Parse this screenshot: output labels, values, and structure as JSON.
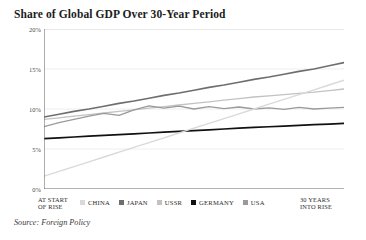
{
  "title": "Share of Global GDP Over 30-Year Period",
  "source": "Source: Foreign Policy",
  "axis": {
    "start_label_line1": "AT START",
    "start_label_line2": "OF RISE",
    "end_label_line1": "30 YEARS",
    "end_label_line2": "INTO RISE"
  },
  "legend": {
    "items": [
      {
        "label": "CHINA",
        "color": "#d9d9d9"
      },
      {
        "label": "JAPAN",
        "color": "#6e6e6e"
      },
      {
        "label": "USSR",
        "color": "#c2c2c2"
      },
      {
        "label": "GERMANY",
        "color": "#111111"
      },
      {
        "label": "USA",
        "color": "#9a9a9a"
      }
    ]
  },
  "chart_data": {
    "type": "line",
    "title": "Share of Global GDP Over 30-Year Period",
    "xlabel": "",
    "ylabel": "",
    "xlim": [
      0,
      30
    ],
    "ylim": [
      0,
      20
    ],
    "yticks": [
      0,
      5,
      10,
      15,
      20
    ],
    "ytick_labels": [
      "0%",
      "5%",
      "10%",
      "15%",
      "20%"
    ],
    "xtick_labels": [
      "AT START OF RISE",
      "30 YEARS INTO RISE"
    ],
    "grid": true,
    "legend_position": "bottom",
    "x": [
      0,
      1.5,
      3,
      4.5,
      6,
      7.5,
      9,
      10.5,
      12,
      13.5,
      15,
      16.5,
      18,
      19.5,
      21,
      22.5,
      24,
      25.5,
      27,
      28.5,
      30
    ],
    "series": [
      {
        "name": "JAPAN",
        "color": "#6e6e6e",
        "width": 1.6,
        "values": [
          9.0,
          9.35,
          9.7,
          10.0,
          10.35,
          10.7,
          11.0,
          11.35,
          11.7,
          12.0,
          12.35,
          12.7,
          13.0,
          13.35,
          13.7,
          14.0,
          14.35,
          14.7,
          15.0,
          15.4,
          15.8
        ]
      },
      {
        "name": "USSR",
        "color": "#c2c2c2",
        "width": 1.3,
        "values": [
          8.7,
          8.9,
          9.1,
          9.3,
          9.5,
          9.7,
          9.9,
          10.1,
          10.3,
          10.5,
          10.7,
          10.9,
          11.1,
          11.3,
          11.5,
          11.65,
          11.8,
          11.95,
          12.1,
          12.3,
          12.5
        ]
      },
      {
        "name": "USA",
        "color": "#9a9a9a",
        "width": 1.3,
        "values": [
          7.8,
          8.3,
          8.7,
          9.1,
          9.45,
          9.2,
          9.9,
          10.4,
          10.1,
          10.35,
          10.0,
          10.3,
          10.05,
          10.25,
          10.0,
          10.15,
          9.95,
          10.2,
          10.0,
          10.1,
          10.2
        ]
      },
      {
        "name": "GERMANY",
        "color": "#111111",
        "width": 1.7,
        "values": [
          6.3,
          6.4,
          6.5,
          6.6,
          6.7,
          6.8,
          6.9,
          7.0,
          7.1,
          7.2,
          7.3,
          7.4,
          7.5,
          7.6,
          7.7,
          7.78,
          7.85,
          7.95,
          8.05,
          8.12,
          8.2
        ]
      },
      {
        "name": "CHINA",
        "color": "#d9d9d9",
        "width": 1.4,
        "values": [
          1.6,
          2.2,
          2.8,
          3.4,
          4.0,
          4.6,
          5.2,
          5.8,
          6.4,
          7.0,
          7.6,
          8.2,
          8.8,
          9.4,
          10.0,
          10.6,
          11.2,
          11.8,
          12.4,
          13.0,
          13.6
        ]
      }
    ]
  }
}
